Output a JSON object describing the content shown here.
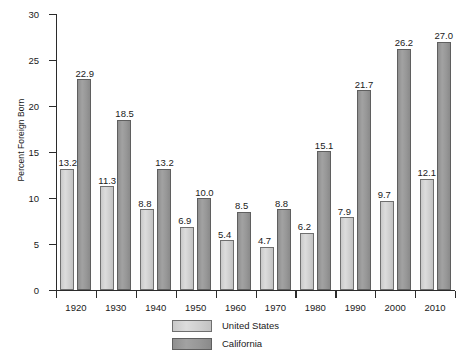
{
  "chart_data": {
    "type": "bar",
    "title": "",
    "xlabel": "",
    "ylabel": "Percent Foreign Born",
    "ylim": [
      0,
      30
    ],
    "yticks": [
      0,
      5,
      10,
      15,
      20,
      25,
      30
    ],
    "grid": false,
    "legend_position": "bottom-center",
    "categories": [
      "1920",
      "1930",
      "1940",
      "1950",
      "1960",
      "1970",
      "1980",
      "1990",
      "2000",
      "2010"
    ],
    "series": [
      {
        "name": "United States",
        "color": "#d0d0d0",
        "values": [
          13.2,
          11.3,
          8.8,
          6.9,
          5.4,
          4.7,
          6.2,
          7.9,
          9.7,
          12.1
        ],
        "labels": [
          "13.2",
          "11.3",
          "8.8",
          "6.9",
          "5.4",
          "4.7",
          "6.2",
          "7.9",
          "9.7",
          "12.1"
        ]
      },
      {
        "name": "California",
        "color": "#999999",
        "values": [
          22.9,
          18.5,
          13.2,
          10.0,
          8.5,
          8.8,
          15.1,
          21.7,
          26.2,
          27.0
        ],
        "labels": [
          "22.9",
          "18.5",
          "13.2",
          "10.0",
          "8.5",
          "8.8",
          "15.1",
          "21.7",
          "26.2",
          "27.0"
        ]
      }
    ]
  },
  "axes": {
    "y_title": "Percent Foreign Born",
    "y_tick_labels": [
      "0",
      "5",
      "10",
      "15",
      "20",
      "25",
      "30"
    ],
    "x_tick_labels": [
      "1920",
      "1930",
      "1940",
      "1950",
      "1960",
      "1970",
      "1980",
      "1990",
      "2000",
      "2010"
    ]
  },
  "legend": {
    "items": [
      {
        "label": "United States",
        "swatch": "light-gray-swatch"
      },
      {
        "label": "California",
        "swatch": "dark-gray-swatch"
      }
    ]
  }
}
